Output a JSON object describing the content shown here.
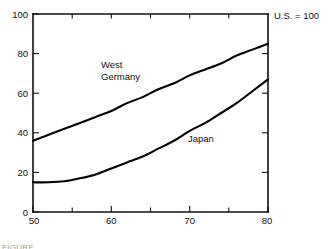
{
  "figure": {
    "background_color": "#ffffff",
    "line_color": "#000000",
    "caption_fragment": "FIGURE"
  },
  "annotations": {
    "index_note": "U.S. = 100",
    "series_label_west_germany_line1": "West",
    "series_label_west_germany_line2": "Germany",
    "series_label_japan": "Japan"
  },
  "axes": {
    "y_ticks": [
      "0",
      "20",
      "40",
      "60",
      "80",
      "100"
    ],
    "x_ticks": [
      "50",
      "60",
      "70",
      "80"
    ]
  },
  "chart_data": {
    "type": "line",
    "title": "",
    "subtitle": "",
    "xlabel": "",
    "ylabel": "",
    "xlim": [
      50,
      80
    ],
    "ylim": [
      0,
      100
    ],
    "grid": false,
    "legend": "inline-labels",
    "annotations": [
      "U.S. = 100"
    ],
    "x_major_ticks": [
      50,
      60,
      70,
      80
    ],
    "x_minor_ticks": [
      55,
      65,
      75
    ],
    "y_major_ticks": [
      0,
      20,
      40,
      60,
      80,
      100
    ],
    "x_tick_labels": [
      "50",
      "60",
      "70",
      "80"
    ],
    "y_tick_labels": [
      "0",
      "20",
      "40",
      "60",
      "80",
      "100"
    ],
    "x": [
      50,
      52,
      54,
      56,
      58,
      60,
      62,
      64,
      66,
      68,
      70,
      72,
      74,
      76,
      78,
      80
    ],
    "series": [
      {
        "name": "West Germany",
        "color": "#000000",
        "values": [
          36,
          39,
          42,
          45,
          48,
          51,
          55,
          58,
          62,
          65,
          69,
          72,
          75,
          79,
          82,
          85
        ]
      },
      {
        "name": "Japan",
        "color": "#000000",
        "values": [
          15,
          15,
          15.5,
          17,
          19,
          22,
          25,
          28,
          32,
          36,
          41,
          45,
          50,
          55,
          61,
          67
        ]
      }
    ]
  }
}
